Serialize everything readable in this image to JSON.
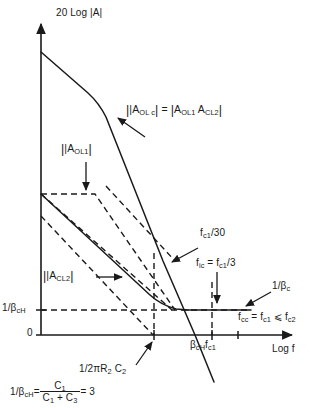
{
  "figure": {
    "type": "bode-magnitude-plot",
    "axes": {
      "y_axis_label": "20 Log |A|",
      "x_axis_label": "Log f",
      "y_tick_labels": [
        "1/βₖₕ",
        "0"
      ],
      "y_tick_zero": "0",
      "y_tick_beta": "1/β",
      "y_tick_beta_sub": "cH"
    },
    "curve_labels": {
      "aolc": {
        "prefix": "|A",
        "sub1": "OL c",
        "mid": "| = |A",
        "sub2": "OL1",
        "mid2": " A",
        "sub3": "CL2",
        "suffix": "|",
        "full_text": "|A_OLc| = |A_OL1 A_CL2|"
      },
      "aol1": {
        "prefix": "|A",
        "sub": "OL1",
        "suffix": "|",
        "full_text": "|A_OL1|"
      },
      "acl2": {
        "prefix": "|A",
        "sub": "CL2",
        "suffix": "|",
        "full_text": "|A_CL2|"
      },
      "one_over_beta_c": {
        "prefix": "1/β",
        "sub": "c",
        "full_text": "1/β_c"
      }
    },
    "annotations": {
      "fc1_over_30": {
        "prefix": "f",
        "sub": "c1",
        "suffix": "/30",
        "full_text": "f_c1/30"
      },
      "fic": {
        "prefix": "f",
        "sub1": "ic",
        "mid": " = f",
        "sub2": "c1",
        "suffix": "/3",
        "full_text": "f_ic = f_c1/3"
      },
      "fcc": {
        "prefix": "f",
        "sub1": "cc",
        "mid": " = f",
        "sub2": "c1",
        "mid2": " ⩽ f",
        "sub3": "c2",
        "full_text": "f_cc = f_c1 ⩽ f_c2"
      },
      "one_over_2piR2C2": {
        "prefix": "1/2πR",
        "sub1": "2",
        "mid": " C",
        "sub2": "2",
        "full_text": "1/2πR₂ C₂"
      },
      "beta_cH_fc1": {
        "prefix": "β",
        "sub1": "cH",
        "mid": "f",
        "sub2": "c1",
        "full_text": "β_cH f_c1"
      }
    },
    "equation": {
      "lhs_prefix": "1/β",
      "lhs_sub": "cH",
      "equals": " = ",
      "numerator": "C",
      "numerator_sub": "1",
      "denominator_a": "C",
      "denominator_a_sub": "1",
      "denominator_plus": " + C",
      "denominator_b_sub": "3",
      "result": " = 3",
      "full_text": "1/β_cH = C₁/(C₁ + C₃) = 3"
    },
    "colors": {
      "ink": "#1a1a1a",
      "background": "#ffffff"
    }
  }
}
